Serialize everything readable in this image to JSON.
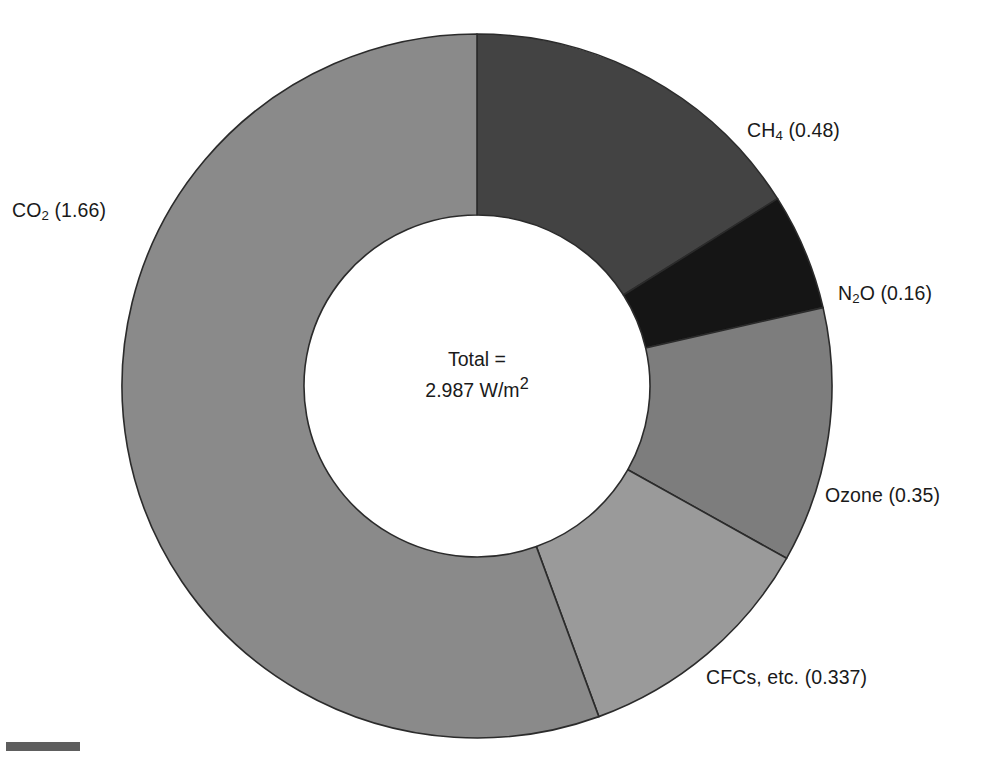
{
  "chart_data": {
    "type": "pie",
    "variant": "donut",
    "title": "",
    "subtitle": "",
    "xlabel": "",
    "ylabel": "",
    "units": "W/m2",
    "total_value": 2.987,
    "total_label_line1": "Total =",
    "total_label_line2_prefix": "2.987 W/m",
    "total_label_line2_sup": "2",
    "start_angle_deg": 0,
    "direction": "clockwise",
    "inner_radius_ratio": 0.487,
    "legend": "none (direct labels)",
    "grid": false,
    "categories": [
      "CH4",
      "N2O",
      "Ozone",
      "CFCs, etc.",
      "CO2"
    ],
    "values": [
      0.48,
      0.16,
      0.35,
      0.337,
      1.66
    ],
    "slices": [
      {
        "id": "ch4",
        "name_prefix": "CH",
        "name_sub": "4",
        "name_suffix": "",
        "label": "CH4 (0.48)",
        "value": 0.48,
        "value_text": "(0.48)",
        "percent": 16.1,
        "start_deg": 0.0,
        "end_deg": 57.85,
        "color": "#434343"
      },
      {
        "id": "n2o",
        "name_prefix": "N",
        "name_sub": "2",
        "name_suffix": "O",
        "label": "N2O (0.16)",
        "value": 0.16,
        "value_text": "(0.16)",
        "percent": 5.36,
        "start_deg": 57.85,
        "end_deg": 77.13,
        "color": "#151515"
      },
      {
        "id": "ozone",
        "name_prefix": "Ozone",
        "name_sub": "",
        "name_suffix": "",
        "label": "Ozone (0.35)",
        "value": 0.35,
        "value_text": "(0.35)",
        "percent": 11.72,
        "start_deg": 77.13,
        "end_deg": 119.31,
        "color": "#7d7d7d"
      },
      {
        "id": "cfcs",
        "name_prefix": "CFCs, etc.",
        "name_sub": "",
        "name_suffix": "",
        "label": "CFCs, etc. (0.337)",
        "value": 0.337,
        "value_text": "(0.337)",
        "percent": 11.28,
        "start_deg": 119.31,
        "end_deg": 159.93,
        "color": "#9a9a9a"
      },
      {
        "id": "co2",
        "name_prefix": "CO",
        "name_sub": "2",
        "name_suffix": "",
        "label": "CO2 (1.66)",
        "value": 1.66,
        "value_text": "(1.66)",
        "percent": 55.57,
        "start_deg": 159.93,
        "end_deg": 360.0,
        "color": "#8a8a8a"
      }
    ],
    "colors": {
      "ch4": "#434343",
      "n2o": "#151515",
      "ozone": "#7d7d7d",
      "cfcs": "#9a9a9a",
      "co2": "#8a8a8a",
      "outline": "#2b2b2b",
      "background": "#ffffff",
      "text": "#1a1a1a"
    },
    "geometry": {
      "center_x": 477,
      "center_y": 386,
      "outer_rx": 355,
      "outer_ry": 352,
      "inner_rx": 173,
      "inner_ry": 171
    }
  }
}
